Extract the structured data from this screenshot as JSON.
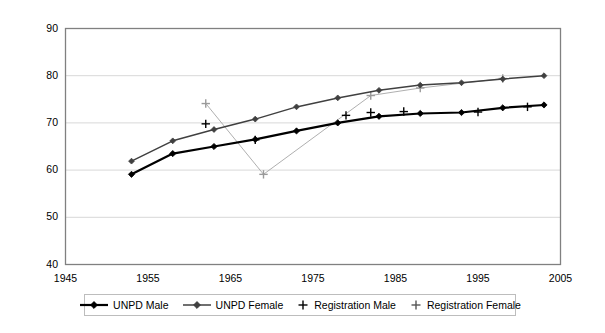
{
  "chart_data": {
    "type": "line",
    "title": "",
    "xlabel": "",
    "ylabel": "",
    "xlim": [
      1945,
      2005
    ],
    "ylim": [
      40,
      90
    ],
    "x_ticks": [
      1945,
      1955,
      1965,
      1975,
      1985,
      1995,
      2005
    ],
    "y_ticks": [
      40,
      50,
      60,
      70,
      80,
      90
    ],
    "grid": "horizontal",
    "legend_position": "bottom-center",
    "series": [
      {
        "name": "UNPD Male",
        "marker": "diamond",
        "line": "solid",
        "color": "#000000",
        "x": [
          1953,
          1958,
          1963,
          1968,
          1973,
          1978,
          1983,
          1988,
          1993,
          1998,
          2003
        ],
        "values": [
          59.1,
          63.5,
          65.0,
          66.5,
          68.3,
          70.0,
          71.4,
          72.0,
          72.2,
          73.2,
          73.8
        ]
      },
      {
        "name": "UNPD Female",
        "marker": "diamond",
        "line": "solid",
        "color": "#404040",
        "x": [
          1953,
          1958,
          1963,
          1968,
          1973,
          1978,
          1983,
          1988,
          1993,
          1998,
          2003
        ],
        "values": [
          61.9,
          66.2,
          68.6,
          70.8,
          73.4,
          75.3,
          76.9,
          78.0,
          78.5,
          79.3,
          80.0
        ]
      },
      {
        "name": "Registration Male",
        "marker": "plus",
        "line": "none",
        "color": "#000000",
        "x": [
          1962,
          1968,
          1979,
          1982,
          1986,
          1995,
          2001
        ],
        "values": [
          69.8,
          66.4,
          71.6,
          72.2,
          72.4,
          72.3,
          73.4
        ]
      },
      {
        "name": "Registration Female",
        "parenthetical": "thin connecting line shown",
        "marker": "plus",
        "line": "thin",
        "color": "#9a9a9a",
        "x": [
          1962,
          1969,
          1982,
          1988,
          1998
        ],
        "values": [
          74.1,
          59.1,
          75.8,
          77.4,
          79.4
        ]
      }
    ]
  },
  "legend": {
    "items": [
      {
        "label": "UNPD Male",
        "marker": "diamond-line-black"
      },
      {
        "label": "UNPD Female",
        "marker": "diamond-line-gray"
      },
      {
        "label": "Registration Male",
        "marker": "plus-black"
      },
      {
        "label": "Registration Female",
        "marker": "plus-gray"
      }
    ]
  },
  "axes": {
    "y_labels": [
      "90",
      "80",
      "70",
      "60",
      "50",
      "40"
    ],
    "x_labels": [
      "1945",
      "1955",
      "1965",
      "1975",
      "1985",
      "1995",
      "2005"
    ]
  }
}
